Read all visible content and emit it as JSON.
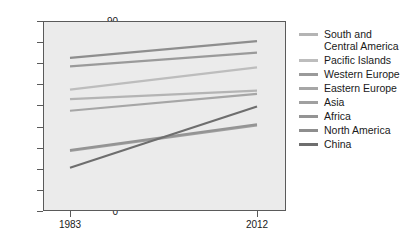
{
  "chart_data": {
    "type": "line",
    "title": "",
    "xlabel": "",
    "ylabel": "",
    "x": [
      1983,
      2012
    ],
    "xtick_labels": [
      "1983",
      "2012"
    ],
    "ytick_labels": [
      "0",
      "10",
      "20",
      "30",
      "40",
      "50",
      "60",
      "70",
      "80",
      "90"
    ],
    "yticks": [
      0,
      10,
      20,
      30,
      40,
      50,
      60,
      70,
      80,
      90
    ],
    "ylim": [
      0,
      90
    ],
    "xlim": [
      1983,
      2012
    ],
    "grid": false,
    "legend_position": "right",
    "plot_background": "#ebebeb",
    "series": [
      {
        "name": "South and Central America",
        "values": [
          53.0,
          57.0
        ],
        "color": "#b4b4b4"
      },
      {
        "name": "Pacific Islands",
        "values": [
          57.5,
          68.0
        ],
        "color": "#bdbdbd"
      },
      {
        "name": "Western Europe",
        "values": [
          68.5,
          75.0
        ],
        "color": "#9a9a9a"
      },
      {
        "name": "Eastern Europe",
        "values": [
          47.5,
          55.5
        ],
        "color": "#a6a6a6"
      },
      {
        "name": "Asia",
        "values": [
          28.5,
          40.5
        ],
        "color": "#a0a0a0"
      },
      {
        "name": "Africa",
        "values": [
          28.8,
          41.0
        ],
        "color": "#949494"
      },
      {
        "name": "North America",
        "values": [
          72.5,
          80.5
        ],
        "color": "#8e8e8e"
      },
      {
        "name": "China",
        "values": [
          20.5,
          49.5
        ],
        "color": "#6e6e6e"
      }
    ]
  },
  "legend": {
    "items": [
      {
        "label": "South and Central America",
        "color": "#b4b4b4"
      },
      {
        "label": "Pacific Islands",
        "color": "#bdbdbd"
      },
      {
        "label": "Western Europe",
        "color": "#9a9a9a"
      },
      {
        "label": "Eastern Europe",
        "color": "#a6a6a6"
      },
      {
        "label": "Asia",
        "color": "#a0a0a0"
      },
      {
        "label": "Africa",
        "color": "#949494"
      },
      {
        "label": "North America",
        "color": "#8e8e8e"
      },
      {
        "label": "China",
        "color": "#6e6e6e"
      }
    ]
  },
  "axes": {
    "y_labels": [
      "90",
      "80",
      "70",
      "60",
      "50",
      "40",
      "30",
      "20",
      "10",
      "0"
    ],
    "x_labels": [
      "1983",
      "2012"
    ]
  }
}
